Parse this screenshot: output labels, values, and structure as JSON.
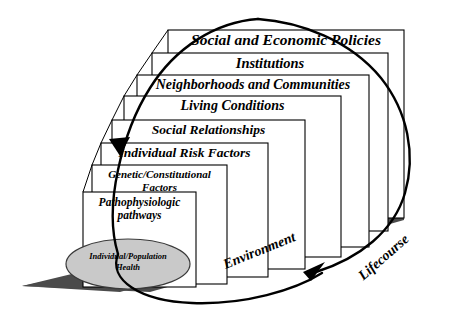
{
  "diagram": {
    "colors": {
      "box_fill": "#ffffff",
      "box_stroke": "#000000",
      "ground_fill": "#4b4b4b",
      "ellipse_fill": "#c9c9c9",
      "ellipse_stroke": "#3a3a3a",
      "arrow_stroke": "#000000",
      "text": "#000000"
    },
    "levels": [
      {
        "id": "social-and-economic-policies",
        "label": "Social and Economic Policies",
        "order": 1,
        "font_size": 15.5
      },
      {
        "id": "institutions",
        "label": "Institutions",
        "order": 2,
        "font_size": 14.5
      },
      {
        "id": "neighborhoods-and-communities",
        "label": "Neighborhoods and Communities",
        "order": 3,
        "font_size": 14
      },
      {
        "id": "living-conditions",
        "label": "Living Conditions",
        "order": 4,
        "font_size": 14
      },
      {
        "id": "social-relationships",
        "label": "Social Relationships",
        "order": 5,
        "font_size": 13.5
      },
      {
        "id": "individual-risk-factors",
        "label": "Individual Risk Factors",
        "order": 6,
        "font_size": 13.5
      },
      {
        "id": "genetic-constitutional-factors",
        "label": "Genetic/Constitutional\nFactors",
        "order": 7,
        "font_size": 11
      },
      {
        "id": "pathophysiologic-pathways",
        "label": "Pathophysiologic\npathways",
        "order": 8,
        "font_size": 11.5
      }
    ],
    "outcome": {
      "id": "individual-population-health",
      "label": "Individual/Population\nHealth",
      "font_size": 8.5
    },
    "axes": [
      {
        "id": "environment",
        "label": "Environment",
        "rotation_deg": -22,
        "font_size": 14
      },
      {
        "id": "lifecourse",
        "label": "Lifecourse",
        "rotation_deg": -41,
        "font_size": 14
      }
    ]
  }
}
